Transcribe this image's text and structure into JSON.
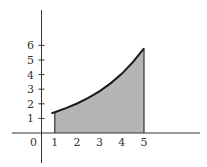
{
  "chart_data": {
    "type": "area",
    "title": "",
    "xlabel": "",
    "ylabel": "",
    "x_ticks": [
      "0",
      "1",
      "2",
      "3",
      "4",
      "5"
    ],
    "y_ticks": [
      "1",
      "2",
      "3",
      "4",
      "5",
      "6"
    ],
    "xlim": [
      -1.3,
      7
    ],
    "ylim": [
      -2,
      8.5
    ],
    "grid": false,
    "legend": null,
    "shaded_region": {
      "x_from": 1,
      "x_to": 5,
      "fill": "#b5b5b5"
    },
    "series": [
      {
        "name": "curve",
        "x": [
          0.85,
          1,
          1.5,
          2,
          2.5,
          3,
          3.5,
          4,
          4.5,
          5
        ],
        "values": [
          1.35,
          1.42,
          1.7,
          2.02,
          2.4,
          2.85,
          3.4,
          4.05,
          4.85,
          5.8
        ]
      }
    ]
  },
  "colors": {
    "axis": "#333333",
    "curve": "#1a1a1a",
    "fill": "#b5b5b5"
  }
}
